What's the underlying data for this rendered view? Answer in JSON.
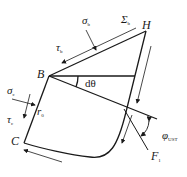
{
  "diagram": {
    "points": {
      "B": "B",
      "H": "H",
      "C": "C"
    },
    "labels": {
      "sigma_b": {
        "symbol": "σ",
        "sub": "b"
      },
      "tau_b": {
        "symbol": "τ",
        "sub": "b"
      },
      "Sigma_b": {
        "symbol": "Σ",
        "sub": "b"
      },
      "sigma_c": {
        "symbol": "σ",
        "sub": "c"
      },
      "tau_c": {
        "symbol": "τ",
        "sub": "c"
      },
      "r_0": {
        "symbol": "r",
        "sub": "0"
      },
      "d_theta": {
        "text": "dθ"
      },
      "phi_ust": {
        "symbol": "φ",
        "sub": "UST"
      },
      "F_1": {
        "symbol": "F",
        "sub": "1"
      }
    },
    "colors": {
      "stroke": "#1a1a1a",
      "background": "#ffffff"
    }
  }
}
